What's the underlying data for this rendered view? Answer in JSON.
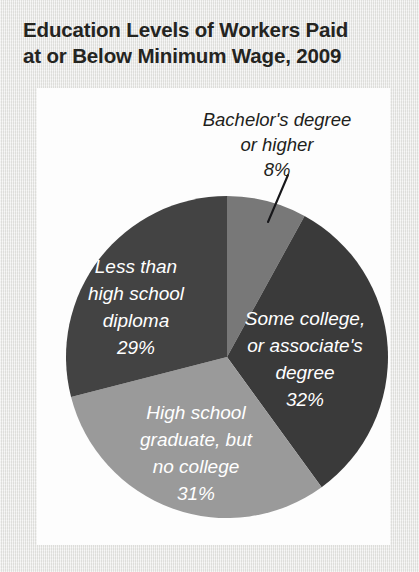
{
  "title": {
    "line1": "Education Levels of Workers Paid",
    "line2": "at or Below Minimum Wage, 2009"
  },
  "chart_data": {
    "type": "pie",
    "title": "Education Levels of Workers Paid at or Below Minimum Wage, 2009",
    "xlabel": "",
    "ylabel": "",
    "units": "percent",
    "start_angle_deg": 0,
    "direction": "clockwise",
    "legend": "none",
    "grid": false,
    "categories": [
      "Bachelor's degree or higher",
      "Some college, or associate's degree",
      "High school graduate, but no college",
      "Less than high school diploma"
    ],
    "values": [
      8,
      32,
      31,
      29
    ],
    "labels": [
      "8%",
      "32%",
      "31%",
      "29%"
    ],
    "colors": [
      "#787878",
      "#3a3a3a",
      "#9a9a9a",
      "#434343"
    ],
    "slices": [
      {
        "name": "bachelors-or-higher",
        "label_line1": "Bachelor's degree",
        "label_line2": "or higher",
        "percent_text": "8%",
        "value": 8,
        "color": "#787878",
        "label_placement": "outside",
        "label_color": "#1f1f1c",
        "has_leader_line": true
      },
      {
        "name": "some-college-or-associates",
        "label_line1": "Some college,",
        "label_line2": "or associate's",
        "label_line3": "degree",
        "percent_text": "32%",
        "value": 32,
        "color": "#3a3a3a",
        "label_placement": "inside",
        "label_color": "#ffffff",
        "has_leader_line": false
      },
      {
        "name": "high-school-graduate-no-college",
        "label_line1": "High school",
        "label_line2": "graduate, but",
        "label_line3": "no college",
        "percent_text": "31%",
        "value": 31,
        "color": "#9a9a9a",
        "label_placement": "inside",
        "label_color": "#ffffff",
        "has_leader_line": false
      },
      {
        "name": "less-than-high-school-diploma",
        "label_line1": "Less than",
        "label_line2": "high school",
        "label_line3": "diploma",
        "percent_text": "29%",
        "value": 29,
        "color": "#434343",
        "label_placement": "inside",
        "label_color": "#ffffff",
        "has_leader_line": false
      }
    ]
  },
  "colors": {
    "page_background": "#e9e9e7",
    "card_background": "#fdfdfd",
    "title_text": "#24241f",
    "slice_dark": "#3a3a3a",
    "slice_dark_alt": "#434343",
    "slice_mid": "#787878",
    "slice_light": "#9a9a9a",
    "label_light": "#ffffff",
    "leader_line": "#17171a"
  }
}
